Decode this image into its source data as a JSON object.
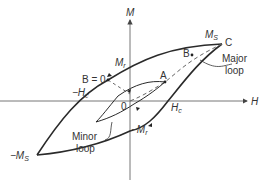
{
  "diagram": {
    "axes": {
      "x_label": "H",
      "y_label": "M"
    },
    "labels": {
      "ms": "M",
      "ms_sub": "S",
      "neg_ms": "−M",
      "neg_ms_sub": "S",
      "mr": "M",
      "mr_sub": "r",
      "neg_mr": "−M",
      "neg_mr_sub": "r",
      "hc": "H",
      "hc_sub": "c",
      "neg_hc": "−H",
      "neg_hc_sub": "c",
      "b_zero": "B = 0",
      "point_a": "A",
      "point_b": "B",
      "point_c": "C",
      "origin": "0",
      "major_loop_line1": "Major",
      "major_loop_line2": "loop",
      "minor_loop_line1": "Minor",
      "minor_loop_line2": "loop"
    },
    "colors": {
      "curve": "#2a2a2a",
      "axis": "#555555",
      "dashed": "#666666"
    }
  }
}
